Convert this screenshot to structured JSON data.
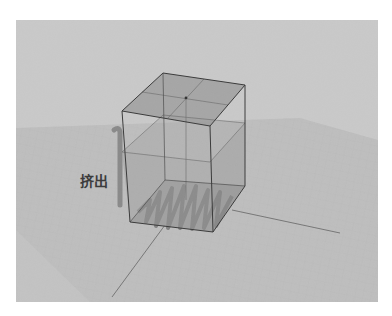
{
  "figure": {
    "label": "挤出",
    "label_meaning": "Extrude",
    "colors": {
      "page_background": "#ffffff",
      "viewport_background": "#c9c9c9",
      "ground_plane": "#bdbdbd",
      "box_fill": "#8f8f8f",
      "box_top_fill": "#9a9a9a",
      "edge": "#3a3a3a",
      "axis_line": "#6e6e6e",
      "profile_zigzag": "#7a7a7a",
      "arrow": "#8a8a8a",
      "label_text": "#3c3c3c"
    },
    "elements": [
      "viewport",
      "ground-grid-plane",
      "axis-lines",
      "extruded-box",
      "zigzag-profile",
      "extrude-arrow",
      "extrude-label"
    ]
  }
}
